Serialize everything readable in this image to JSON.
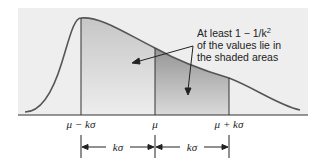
{
  "diagram": {
    "annotation": {
      "lines": [
        "At least 1 − 1/k",
        "of the values lie in",
        "the shaded areas"
      ],
      "superscript": "2"
    },
    "axis_labels": {
      "left": "μ − kσ",
      "center": "μ",
      "right": "μ + kσ"
    },
    "intervals": {
      "left": "kσ",
      "right": "kσ"
    },
    "colors": {
      "panel": "#eeeeee",
      "curve": "#555555",
      "shade_light_top": "#c9c9c9",
      "shade_light_bottom": "#ececec",
      "shade_dark_top": "#9a9a9a",
      "shade_dark_bottom": "#dcdcdc",
      "line": "#333333"
    }
  }
}
